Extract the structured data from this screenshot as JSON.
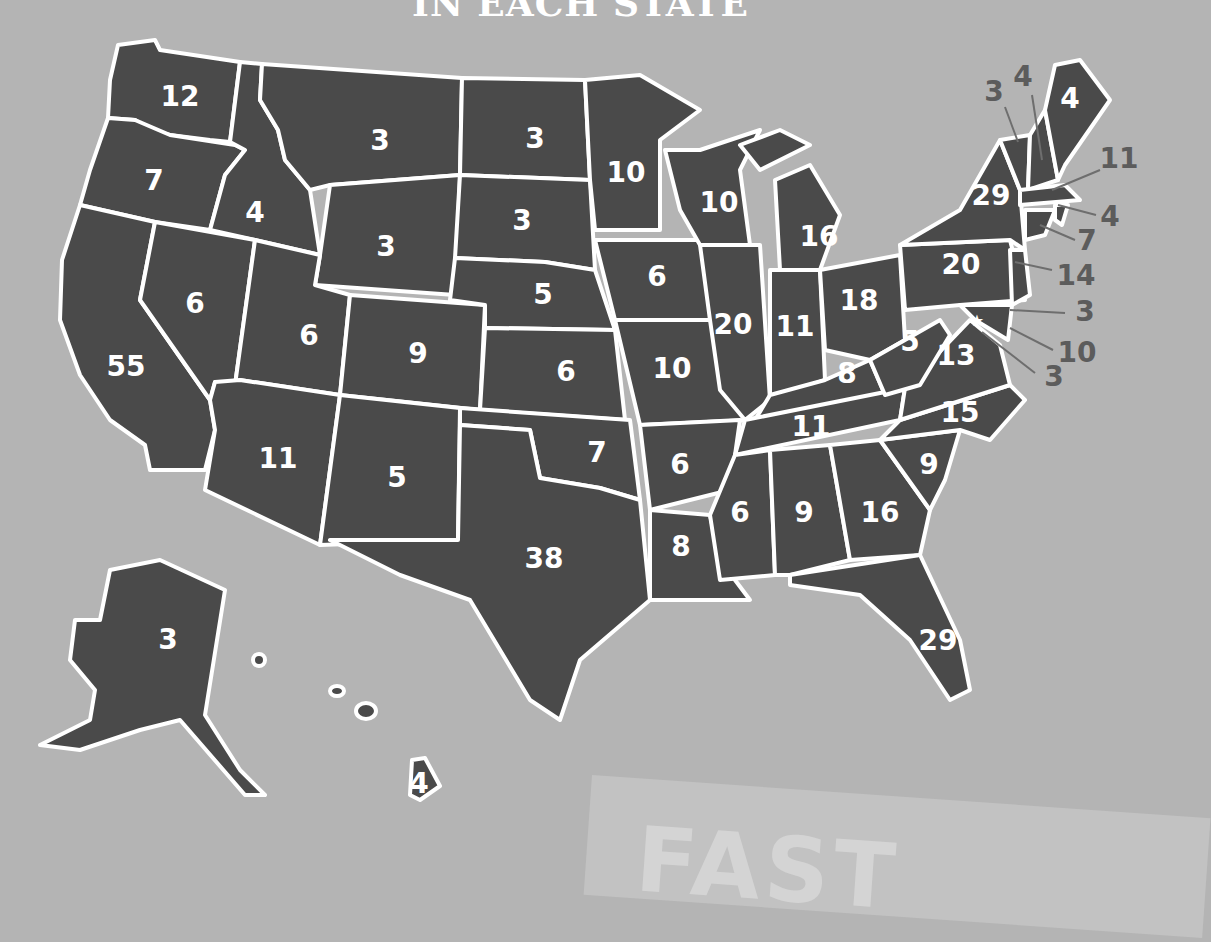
{
  "header": {
    "title": "IN EACH STATE"
  },
  "colors": {
    "background": "#b4b4b4",
    "state_fill": "#4a4a4a",
    "border": "#ffffff",
    "callout_text": "#5c5c5c"
  },
  "states": {
    "WA": "12",
    "OR": "7",
    "CA": "55",
    "ID": "4",
    "NV": "6",
    "MT": "3",
    "WY": "3",
    "UT": "6",
    "AZ": "11",
    "CO": "9",
    "NM": "5",
    "ND": "3",
    "SD": "3",
    "NE": "5",
    "KS": "6",
    "OK": "7",
    "TX": "38",
    "MN": "10",
    "IA": "6",
    "MO": "10",
    "AR": "6",
    "LA": "8",
    "WI": "10",
    "IL": "20",
    "MI": "16",
    "IN": "11",
    "OH": "18",
    "KY": "8",
    "TN": "11",
    "MS": "6",
    "AL": "9",
    "GA": "16",
    "FL": "29",
    "SC": "9",
    "NC": "15",
    "VA": "13",
    "WV": "5",
    "PA": "20",
    "NY": "29",
    "ME": "4",
    "AK": "3",
    "HI": "4"
  },
  "callouts": {
    "VT": "3",
    "NH": "4",
    "MA": "11",
    "RI": "4",
    "CT": "7",
    "NJ": "14",
    "DE": "3",
    "MD": "10",
    "DC": "3"
  },
  "footer_card": {
    "text": "FAST"
  }
}
